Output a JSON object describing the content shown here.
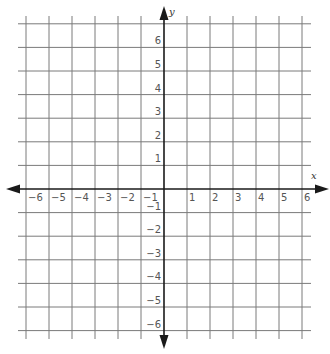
{
  "chart_data": {
    "type": "coordinate-grid",
    "title": "",
    "xlabel": "x",
    "ylabel": "y",
    "xlim": [
      -6,
      6
    ],
    "ylim": [
      -6,
      7
    ],
    "grid": true,
    "x_ticks": [
      -6,
      -5,
      -4,
      -3,
      -2,
      -1,
      1,
      2,
      3,
      4,
      5,
      6
    ],
    "y_ticks": [
      6,
      5,
      4,
      3,
      2,
      1,
      -1,
      -2,
      -3,
      -4,
      -5,
      -6
    ],
    "x_tick_labels": [
      "−6",
      "−5",
      "−4",
      "−3",
      "−2",
      "−1",
      "1",
      "2",
      "3",
      "4",
      "5",
      "6"
    ],
    "y_tick_labels": [
      "6",
      "5",
      "4",
      "3",
      "2",
      "1",
      "−1",
      "−2",
      "−3",
      "−4",
      "−5",
      "−6"
    ],
    "series": []
  },
  "colors": {
    "grid": "#7a7a7a",
    "axis": "#1a1a1a",
    "labels": "#555555",
    "background": "#ffffff"
  }
}
